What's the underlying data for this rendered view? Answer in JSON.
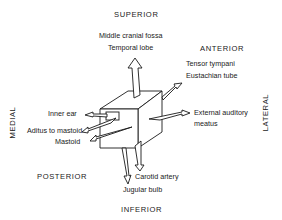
{
  "directions": {
    "superior": "SUPERIOR",
    "anterior": "ANTERIOR",
    "medial": "MEDIAL",
    "lateral": "LATERAL",
    "posterior": "POSTERIOR",
    "inferior": "INFERIOR"
  },
  "labels": {
    "superior_1": "Middle cranial fossa",
    "superior_2": "Temporal lobe",
    "anterior_1": "Tensor tympani",
    "anterior_2": "Eustachian tube",
    "medial_1": "Inner ear",
    "posterior_1": "Aditus to mastoid",
    "posterior_2": "Mastoid",
    "lateral_1": "External auditory",
    "lateral_2": "meatus",
    "inferior_1": "Carotid artery",
    "inferior_2": "Jugular bulb"
  },
  "colors": {
    "stroke": "#1a1a1a",
    "background": "#ffffff"
  }
}
